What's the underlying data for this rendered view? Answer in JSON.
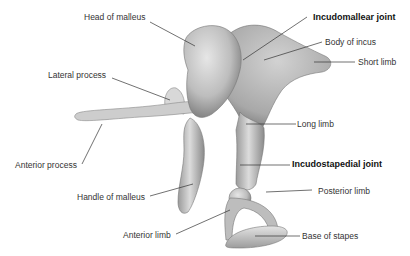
{
  "figure": {
    "background": "#ffffff",
    "bone_color": "#c8c8c8",
    "leader_color": "#333333"
  },
  "labels": {
    "head_of_malleus": "Head of malleus",
    "incudomallear_joint": "Incudomallear joint",
    "body_of_incus": "Body of incus",
    "short_limb": "Short limb",
    "lateral_process": "Lateral process",
    "long_limb": "Long limb",
    "anterior_process": "Anterior process",
    "incudostapedial_joint": "Incudostapedial joint",
    "posterior_limb": "Posterior limb",
    "handle_of_malleus": "Handle of malleus",
    "anterior_limb": "Anterior limb",
    "base_of_stapes": "Base of stapes"
  }
}
